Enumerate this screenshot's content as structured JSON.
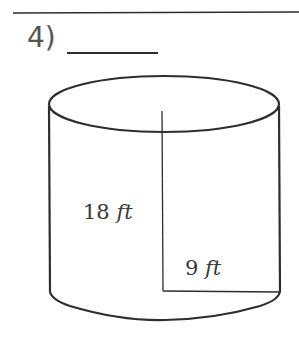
{
  "problem": {
    "number_label": "4)",
    "answer_blank": ""
  },
  "figure": {
    "shape": "cylinder",
    "height": {
      "value": "18",
      "unit": "ft"
    },
    "radius": {
      "value": "9",
      "unit": "ft"
    },
    "stroke_color": "#2e2e2e",
    "text_color": "#3a3a3a"
  }
}
